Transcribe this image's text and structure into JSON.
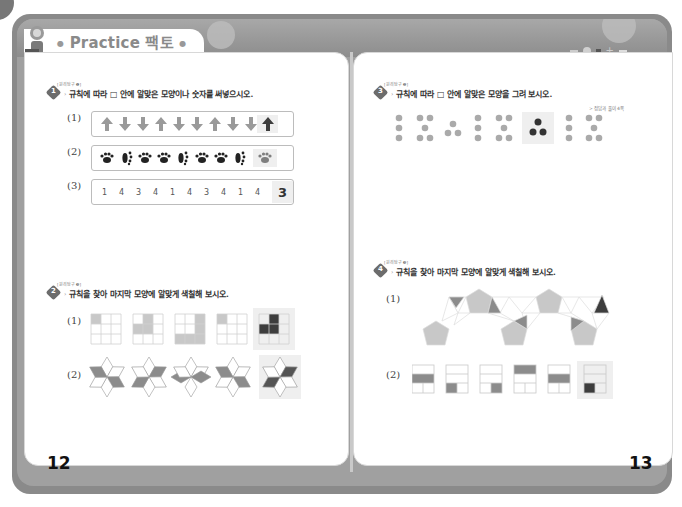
{
  "header": {
    "title_en": "Practice",
    "title_ko": "팩토",
    "ref_link": "> 정답과 풀이 4쪽"
  },
  "left_page": {
    "page_number": "12",
    "problems": [
      {
        "tag": "[원리탐구 ❶]",
        "number": "1",
        "instruction": "규칙에 따라 □ 안에 알맞은 모양이나 숫자를 써넣으시오.",
        "items": [
          {
            "label": "(1)",
            "type": "arrows",
            "sequence": [
              "up",
              "down",
              "down",
              "up",
              "down",
              "down",
              "up",
              "down",
              "down"
            ],
            "answer": "up"
          },
          {
            "label": "(2)",
            "type": "paws",
            "sequence": [
              "paw-front",
              "paw-side",
              "paw-front",
              "paw-front",
              "paw-side",
              "paw-front",
              "paw-front",
              "paw-side"
            ],
            "answer": "paw-front"
          },
          {
            "label": "(3)",
            "type": "numbers",
            "sequence": [
              "1",
              "4",
              "3",
              "4",
              "1",
              "4",
              "3",
              "4",
              "1",
              "4"
            ],
            "answer": "3"
          }
        ]
      },
      {
        "tag": "[원리탐구 ❸]",
        "number": "2",
        "instruction": "규칙을 찾아 마지막 모양에 알맞게 색칠해 보시오.",
        "items": [
          {
            "label": "(1)",
            "type": "grid-3x3"
          },
          {
            "label": "(2)",
            "type": "star-rhombus"
          }
        ]
      }
    ]
  },
  "right_page": {
    "page_number": "13",
    "problems": [
      {
        "tag": "[원리탐구 ❷]",
        "number": "3",
        "instruction": "규칙에 따라 □ 안에 알맞은 모양을 그려 보시오.",
        "items": [
          {
            "type": "dots",
            "sequence": [
              3,
              5,
              3,
              3,
              5,
              3,
              3,
              5
            ]
          }
        ]
      },
      {
        "tag": "[원리탐구 ❸]",
        "number": "4",
        "instruction": "규칙을 찾아 마지막 모양에 알맞게 색칠해 보시오.",
        "items": [
          {
            "label": "(1)",
            "type": "pentagon-chain"
          },
          {
            "label": "(2)",
            "type": "rect-3rows"
          }
        ]
      }
    ]
  },
  "colors": {
    "frame": "#8a8a8a",
    "light_fill": "#c8c8c8",
    "mid_fill": "#8c8c8c",
    "dark_fill": "#3d3d3d",
    "answer_bg": "#efefef"
  }
}
